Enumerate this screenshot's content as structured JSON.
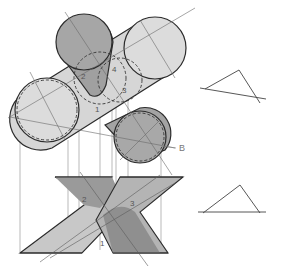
{
  "diagram": {
    "type": "descriptive-geometry",
    "labels": {
      "point_1": "1",
      "point_2": "2",
      "point_3": "3",
      "point_4": "4",
      "axis_b": "B"
    },
    "views": [
      "top-view-cylinders",
      "front-view-x-planes",
      "auxiliary-triangle-top",
      "auxiliary-triangle-bottom"
    ],
    "colors": {
      "light_fill": "#d9d9d9",
      "dark_fill": "#9a9a9a",
      "outline": "#2b2b2b",
      "construction_line": "#7a7a7a",
      "background": "#ffffff"
    }
  }
}
